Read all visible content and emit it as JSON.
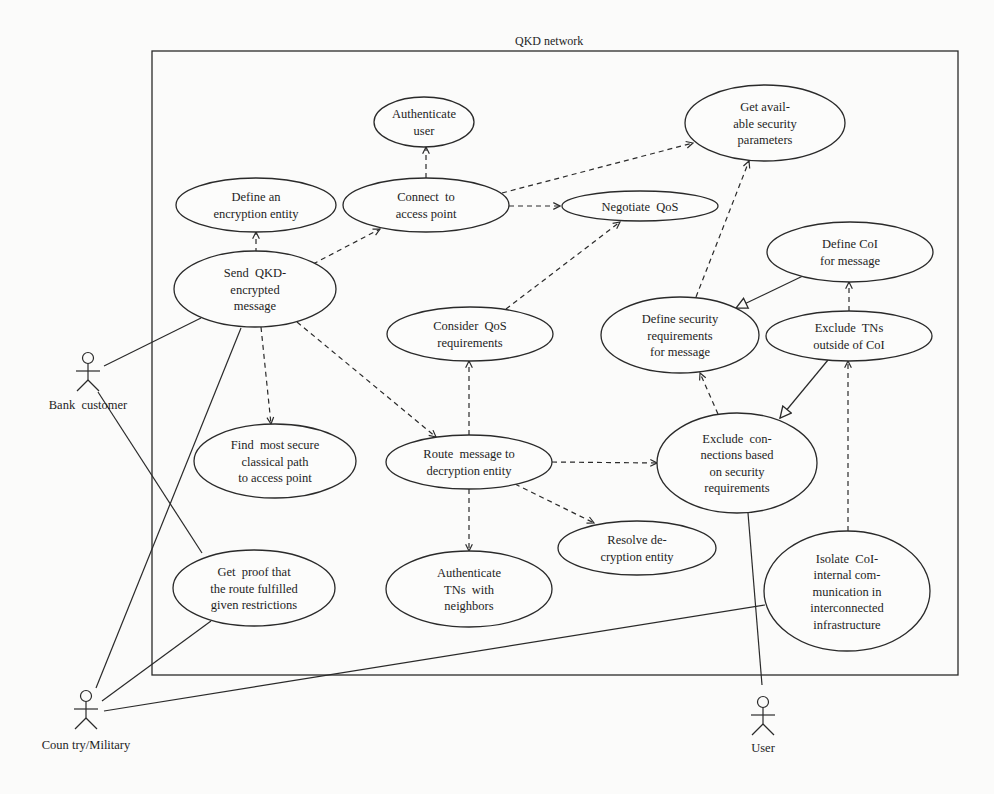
{
  "diagram": {
    "title": "QKD network",
    "frame": {
      "x": 152,
      "y": 51,
      "w": 806,
      "h": 624
    },
    "use_cases": [
      {
        "id": "authenticate_user",
        "lines": [
          "Authenticate",
          "user"
        ],
        "cx": 424,
        "cy": 122,
        "rx": 50,
        "ry": 25
      },
      {
        "id": "get_security_params",
        "lines": [
          "Get avail-",
          "able security",
          "parameters"
        ],
        "cx": 765,
        "cy": 123,
        "rx": 80,
        "ry": 38
      },
      {
        "id": "define_encryption_entity",
        "lines": [
          "Define an",
          "encryption entity"
        ],
        "cx": 256,
        "cy": 205,
        "rx": 80,
        "ry": 27
      },
      {
        "id": "connect_access_point",
        "lines": [
          "Connect  to",
          "access point"
        ],
        "cx": 426,
        "cy": 205,
        "rx": 83,
        "ry": 27
      },
      {
        "id": "negotiate_qos",
        "lines": [
          "Negotiate  QoS"
        ],
        "cx": 640,
        "cy": 206,
        "rx": 78,
        "ry": 15
      },
      {
        "id": "send_qkd_message",
        "lines": [
          "Send  QKD-",
          "encrypted",
          "message"
        ],
        "cx": 255,
        "cy": 289,
        "rx": 81,
        "ry": 38
      },
      {
        "id": "define_coi",
        "lines": [
          "Define CoI",
          "for message"
        ],
        "cx": 850,
        "cy": 252,
        "rx": 83,
        "ry": 30
      },
      {
        "id": "consider_qos",
        "lines": [
          "Consider  QoS",
          "requirements"
        ],
        "cx": 470,
        "cy": 334,
        "rx": 83,
        "ry": 27
      },
      {
        "id": "define_security_req",
        "lines": [
          "Define security",
          "requirements",
          "for message"
        ],
        "cx": 680,
        "cy": 335,
        "rx": 79,
        "ry": 38
      },
      {
        "id": "exclude_tns",
        "lines": [
          "Exclude  TNs",
          "outside of CoI"
        ],
        "cx": 849,
        "cy": 336,
        "rx": 83,
        "ry": 25
      },
      {
        "id": "find_secure_path",
        "lines": [
          "Find  most secure",
          "classical path",
          "to access point"
        ],
        "cx": 275,
        "cy": 461,
        "rx": 81,
        "ry": 37
      },
      {
        "id": "route_message",
        "lines": [
          "Route  message to",
          "decryption entity"
        ],
        "cx": 469,
        "cy": 462,
        "rx": 83,
        "ry": 27
      },
      {
        "id": "exclude_connections",
        "lines": [
          "Exclude  con-",
          "nections based",
          "on security",
          "requirements"
        ],
        "cx": 737,
        "cy": 463,
        "rx": 80,
        "ry": 50
      },
      {
        "id": "resolve_decryption",
        "lines": [
          "Resolve de-",
          "cryption entity"
        ],
        "cx": 637,
        "cy": 548,
        "rx": 79,
        "ry": 27
      },
      {
        "id": "get_proof",
        "lines": [
          "Get  proof that",
          "the route fulfilled",
          "given restrictions"
        ],
        "cx": 254,
        "cy": 588,
        "rx": 81,
        "ry": 38
      },
      {
        "id": "authenticate_tns",
        "lines": [
          "Authenticate",
          "TNs  with",
          "neighbors"
        ],
        "cx": 469,
        "cy": 589,
        "rx": 83,
        "ry": 38
      },
      {
        "id": "isolate_coi",
        "lines": [
          "Isolate  CoI-",
          "internal com-",
          "munication in",
          "interconnected",
          "infrastructure"
        ],
        "cx": 847,
        "cy": 591,
        "rx": 83,
        "ry": 60
      }
    ],
    "actors": [
      {
        "id": "bank_customer",
        "label": "Bank  customer",
        "x": 88,
        "y": 370,
        "label_y": 409
      },
      {
        "id": "country_military",
        "label": "Coun try/Military",
        "x": 86,
        "y": 708,
        "label_y": 749
      },
      {
        "id": "user",
        "label": "User",
        "x": 763,
        "y": 714,
        "label_y": 752
      }
    ],
    "associations": [
      {
        "from": [
          104,
          366
        ],
        "to": [
          201,
          318
        ]
      },
      {
        "from": [
          98,
          392
        ],
        "to": [
          202,
          553
        ]
      },
      {
        "from": [
          96,
          688
        ],
        "to": [
          241,
          328
        ]
      },
      {
        "from": [
          102,
          701
        ],
        "to": [
          211,
          621
        ]
      },
      {
        "from": [
          104,
          711
        ],
        "to": [
          765,
          605
        ]
      },
      {
        "from": [
          748,
          513
        ],
        "to": [
          762,
          685
        ]
      }
    ],
    "includes": [
      {
        "from": [
          256,
          262
        ],
        "to": [
          256,
          232
        ],
        "arrow": "open"
      },
      {
        "from": [
          313,
          264
        ],
        "to": [
          380,
          229
        ],
        "arrow": "open"
      },
      {
        "from": [
          426,
          178
        ],
        "to": [
          426,
          147
        ],
        "arrow": "open"
      },
      {
        "from": [
          502,
          193
        ],
        "to": [
          693,
          143
        ],
        "arrow": "open"
      },
      {
        "from": [
          509,
          206
        ],
        "to": [
          560,
          206
        ],
        "arrow": "open"
      },
      {
        "from": [
          506,
          309
        ],
        "to": [
          620,
          222
        ],
        "arrow": "open"
      },
      {
        "from": [
          261,
          327
        ],
        "to": [
          271,
          424
        ],
        "arrow": "open"
      },
      {
        "from": [
          297,
          322
        ],
        "to": [
          436,
          437
        ],
        "arrow": "open"
      },
      {
        "from": [
          469,
          435
        ],
        "to": [
          469,
          361
        ],
        "arrow": "open"
      },
      {
        "from": [
          469,
          489
        ],
        "to": [
          469,
          551
        ],
        "arrow": "open"
      },
      {
        "from": [
          515,
          484
        ],
        "to": [
          594,
          523
        ],
        "arrow": "open"
      },
      {
        "from": [
          552,
          462
        ],
        "to": [
          657,
          463
        ],
        "arrow": "open"
      },
      {
        "from": [
          696,
          297
        ],
        "to": [
          749,
          161
        ],
        "arrow": "open"
      },
      {
        "from": [
          718,
          414
        ],
        "to": [
          700,
          373
        ],
        "arrow": "open"
      },
      {
        "from": [
          849,
          311
        ],
        "to": [
          849,
          282
        ],
        "arrow": "open"
      },
      {
        "from": [
          848,
          531
        ],
        "to": [
          848,
          361
        ],
        "arrow": "open"
      }
    ],
    "generalizations": [
      {
        "from": [
          807,
          274
        ],
        "to": [
          736,
          308
        ]
      },
      {
        "from": [
          828,
          360
        ],
        "to": [
          780,
          418
        ]
      }
    ],
    "colors": {
      "line": "#2a2a2a",
      "text": "#1e1e1e",
      "background": "#fbfbfa",
      "fill": "#fcfcfb"
    }
  }
}
